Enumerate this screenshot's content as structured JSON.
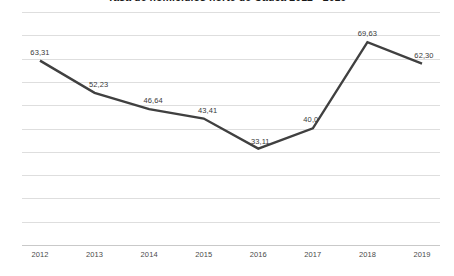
{
  "chart_data": {
    "type": "line",
    "title": "Tasa de homicidios norte de Cauca 2012 - 2019",
    "xlabel": "",
    "ylabel": "",
    "categories": [
      "2012",
      "2013",
      "2014",
      "2015",
      "2016",
      "2017",
      "2018",
      "2019"
    ],
    "values": [
      63.31,
      52.23,
      46.64,
      43.41,
      33.11,
      40.05,
      69.63,
      62.3
    ],
    "point_labels": [
      "63,31",
      "52,23",
      "46,64",
      "43,41",
      "33,11",
      "40,0",
      "69,63",
      "62,30"
    ],
    "ylim": [
      0,
      80
    ],
    "grid": true,
    "gridline_count": 10,
    "legend": "none",
    "series": [
      {
        "name": "Tasa de homicidios",
        "values": [
          63.31,
          52.23,
          46.64,
          43.41,
          33.11,
          40.05,
          69.63,
          62.3
        ]
      }
    ],
    "colors": {
      "line": "#404040",
      "gridline": "#dedede",
      "axis": "#c9c9c9",
      "label_text": "#3a3a3a",
      "title_text": "#1a1a1a",
      "background": "#ffffff"
    },
    "label_offsets": [
      {
        "dx": 0,
        "dy": -13
      },
      {
        "dx": 4,
        "dy": -13
      },
      {
        "dx": 4,
        "dy": -13
      },
      {
        "dx": 4,
        "dy": -13
      },
      {
        "dx": 2,
        "dy": -12
      },
      {
        "dx": -2,
        "dy": -13
      },
      {
        "dx": 0,
        "dy": -13
      },
      {
        "dx": 2,
        "dy": -13
      }
    ]
  }
}
